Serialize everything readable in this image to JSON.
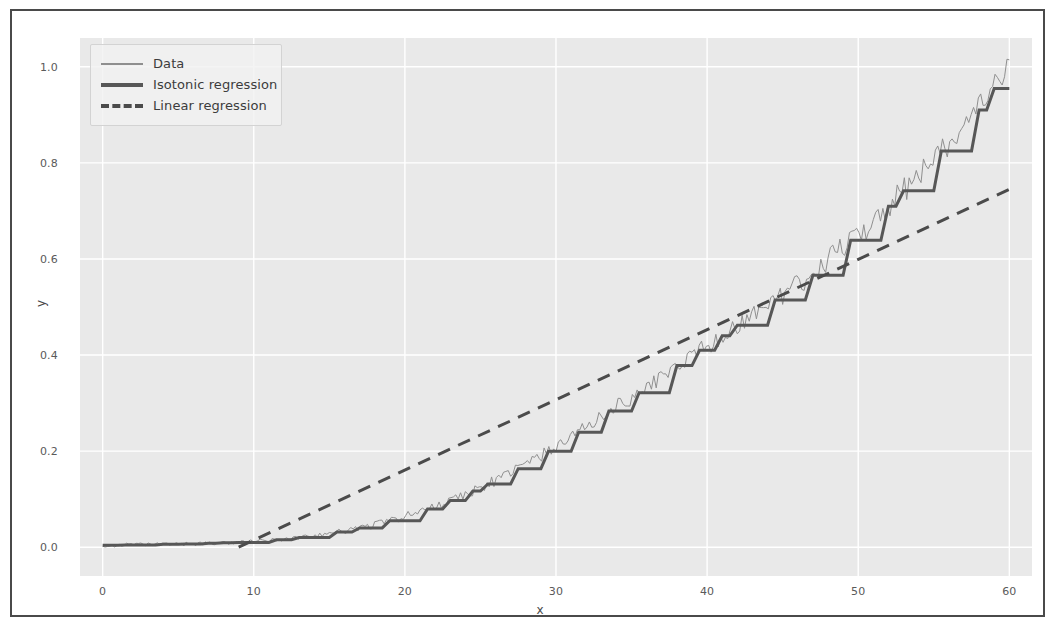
{
  "figure": {
    "background": "#ffffff",
    "frame_color": "#4a4a4a",
    "axes_background": "#e9e9e9",
    "grid_color": "#ffffff"
  },
  "legend": {
    "position": "upper left",
    "entries": [
      {
        "label": "Data",
        "swatch": "thin-line-swatch",
        "color": "#8f8f8f",
        "style": "solid"
      },
      {
        "label": "Isotonic regression",
        "swatch": "thick-line-swatch",
        "color": "#575757",
        "style": "solid"
      },
      {
        "label": "Linear regression",
        "swatch": "dashed-line-swatch",
        "color": "#4b4b4b",
        "style": "dashed"
      }
    ]
  },
  "chart_data": {
    "type": "line",
    "title": "",
    "xlabel": "x",
    "ylabel": "y",
    "xlim": [
      -1.5,
      61.5
    ],
    "ylim": [
      -0.06,
      1.06
    ],
    "xticks": [
      0,
      10,
      20,
      30,
      40,
      50,
      60
    ],
    "yticks": [
      0.0,
      0.2,
      0.4,
      0.6,
      0.8,
      1.0
    ],
    "xticklabels": [
      "0",
      "10",
      "20",
      "30",
      "40",
      "50",
      "60"
    ],
    "yticklabels": [
      "0.0",
      "0.2",
      "0.4",
      "0.6",
      "0.8",
      "1.0"
    ],
    "grid": true,
    "legend_position": "upper left",
    "series": [
      {
        "name": "Data",
        "type": "line",
        "color": "#8f8f8f",
        "linewidth": 1,
        "style": "solid",
        "note": "noisy observations scattered about the isotonic fit",
        "x": [
          0,
          1,
          2,
          3,
          4,
          5,
          6,
          7,
          8,
          9,
          10,
          11,
          12,
          13,
          14,
          15,
          16,
          17,
          18,
          19,
          20,
          21,
          22,
          23,
          24,
          25,
          26,
          27,
          28,
          29,
          30,
          31,
          32,
          33,
          34,
          35,
          36,
          37,
          38,
          39,
          40,
          41,
          42,
          43,
          44,
          45,
          46,
          47,
          48,
          49,
          50,
          51,
          52,
          53,
          54,
          55,
          56,
          57,
          58,
          59,
          60
        ],
        "y": [
          0.004,
          0.004,
          0.005,
          0.005,
          0.006,
          0.006,
          0.007,
          0.008,
          0.009,
          0.01,
          0.012,
          0.014,
          0.017,
          0.02,
          0.024,
          0.029,
          0.034,
          0.04,
          0.047,
          0.055,
          0.064,
          0.074,
          0.085,
          0.097,
          0.11,
          0.124,
          0.139,
          0.155,
          0.172,
          0.19,
          0.209,
          0.229,
          0.25,
          0.272,
          0.295,
          0.31,
          0.333,
          0.355,
          0.378,
          0.402,
          0.418,
          0.44,
          0.462,
          0.484,
          0.505,
          0.524,
          0.546,
          0.566,
          0.6,
          0.627,
          0.651,
          0.678,
          0.71,
          0.742,
          0.775,
          0.808,
          0.842,
          0.876,
          0.91,
          0.955,
          1.01
        ]
      },
      {
        "name": "Isotonic regression",
        "type": "step",
        "color": "#575757",
        "linewidth": 3,
        "style": "solid",
        "note": "monotone non-decreasing step fit",
        "x": [
          0,
          1,
          2,
          3,
          4,
          5,
          6,
          7,
          8,
          9,
          10,
          11,
          12,
          13,
          14,
          15,
          16,
          17,
          18,
          19,
          20,
          21,
          22,
          23,
          24,
          25,
          26,
          27,
          28,
          29,
          30,
          31,
          32,
          33,
          34,
          35,
          36,
          37,
          38,
          39,
          40,
          41,
          42,
          43,
          44,
          45,
          46,
          47,
          48,
          49,
          50,
          51,
          52,
          53,
          54,
          55,
          56,
          57,
          58,
          59,
          60
        ],
        "y": [
          0.004,
          0.004,
          0.005,
          0.005,
          0.006,
          0.006,
          0.007,
          0.008,
          0.009,
          0.01,
          0.012,
          0.014,
          0.017,
          0.02,
          0.024,
          0.029,
          0.034,
          0.04,
          0.047,
          0.055,
          0.064,
          0.074,
          0.085,
          0.097,
          0.11,
          0.124,
          0.139,
          0.155,
          0.172,
          0.19,
          0.209,
          0.229,
          0.25,
          0.272,
          0.295,
          0.31,
          0.333,
          0.355,
          0.378,
          0.402,
          0.418,
          0.44,
          0.462,
          0.484,
          0.505,
          0.524,
          0.546,
          0.566,
          0.6,
          0.627,
          0.651,
          0.678,
          0.71,
          0.742,
          0.775,
          0.808,
          0.842,
          0.876,
          0.91,
          0.955,
          1.01
        ]
      },
      {
        "name": "Linear regression",
        "type": "line",
        "color": "#4b4b4b",
        "linewidth": 3,
        "style": "dashed",
        "note": "ordinary least squares fit; crosses y=0 near x=9",
        "x": [
          9.0,
          60.0
        ],
        "y": [
          0.0,
          0.745
        ],
        "slope": 0.01461,
        "intercept": -0.1315
      }
    ]
  }
}
